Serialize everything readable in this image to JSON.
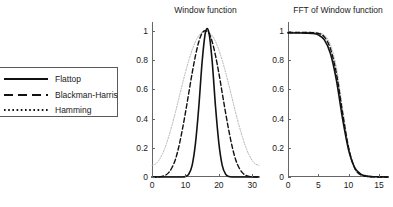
{
  "figure": {
    "background": "#ffffff",
    "width": 393,
    "height": 207
  },
  "legend": {
    "entries": [
      {
        "label": "Flattop",
        "style": "solid",
        "color": "#111111",
        "icon": "solid-line-icon"
      },
      {
        "label": "Blackman-Harris",
        "style": "dashed",
        "color": "#111111",
        "icon": "dashed-line-icon"
      },
      {
        "label": "Hamming",
        "style": "dotted",
        "color": "#111111",
        "icon": "dotted-line-icon"
      }
    ]
  },
  "chart_data": [
    {
      "type": "line",
      "id": "window-function",
      "title": "Window function",
      "xlabel": "",
      "ylabel": "",
      "xlim": [
        0,
        32
      ],
      "ylim": [
        0,
        1.06
      ],
      "grid": false,
      "legend_position": "outside-left",
      "xticks": [
        0,
        10,
        20,
        30
      ],
      "xtick_labels": [
        "0",
        "10",
        "20",
        "30"
      ],
      "yticks": [
        0,
        0.2,
        0.4,
        0.6,
        0.8,
        1
      ],
      "ytick_labels": [
        "0",
        "0.2",
        "0.4",
        "0.6",
        "0.8",
        "1"
      ],
      "x": [
        0,
        1,
        2,
        3,
        4,
        5,
        6,
        7,
        8,
        9,
        10,
        11,
        12,
        13,
        14,
        15,
        16,
        17,
        18,
        19,
        20,
        21,
        22,
        23,
        24,
        25,
        26,
        27,
        28,
        29,
        30,
        31,
        32
      ],
      "series": [
        {
          "name": "Flattop",
          "style": "solid",
          "color": "#111111",
          "width": 1.6,
          "values": [
            0,
            0,
            0,
            0,
            0,
            0,
            0,
            0,
            0,
            0,
            0.004,
            0.02,
            0.08,
            0.23,
            0.48,
            0.79,
            0.99,
            0.99,
            0.79,
            0.48,
            0.23,
            0.08,
            0.02,
            0.004,
            0,
            0,
            0,
            0,
            0,
            0,
            0,
            0,
            0
          ]
        },
        {
          "name": "Blackman-Harris",
          "style": "dashed",
          "color": "#111111",
          "width": 1.4,
          "values": [
            0,
            0.0001,
            0.001,
            0.004,
            0.012,
            0.03,
            0.065,
            0.12,
            0.205,
            0.315,
            0.44,
            0.575,
            0.71,
            0.83,
            0.925,
            0.985,
            1.0,
            0.985,
            0.925,
            0.83,
            0.71,
            0.575,
            0.44,
            0.315,
            0.205,
            0.12,
            0.065,
            0.03,
            0.012,
            0.004,
            0.001,
            0.0001,
            0
          ]
        },
        {
          "name": "Hamming",
          "style": "dotted",
          "color": "#b0b0b0",
          "width": 1.0,
          "values": [
            0.08,
            0.088,
            0.112,
            0.152,
            0.207,
            0.276,
            0.355,
            0.442,
            0.534,
            0.627,
            0.716,
            0.798,
            0.869,
            0.926,
            0.966,
            0.99,
            1.0,
            0.99,
            0.966,
            0.926,
            0.869,
            0.798,
            0.716,
            0.627,
            0.534,
            0.442,
            0.355,
            0.276,
            0.207,
            0.152,
            0.112,
            0.088,
            0.08
          ]
        }
      ]
    },
    {
      "type": "line",
      "id": "fft-of-window-function",
      "title": "FFT of Window function",
      "xlabel": "",
      "ylabel": "",
      "xlim": [
        0,
        16.5
      ],
      "ylim": [
        0,
        1.06
      ],
      "grid": false,
      "legend_position": "outside-left",
      "xticks": [
        0,
        5,
        10,
        15
      ],
      "xtick_labels": [
        "0",
        "5",
        "10",
        "15"
      ],
      "yticks": [
        0,
        0.2,
        0.4,
        0.6,
        0.8,
        1
      ],
      "ytick_labels": [
        "0",
        "0.2",
        "0.4",
        "0.6",
        "0.8",
        "1"
      ],
      "x": [
        0,
        1,
        2,
        3,
        4,
        5,
        6,
        7,
        8,
        9,
        10,
        11,
        12,
        13,
        14,
        15,
        16,
        16.5
      ],
      "series": [
        {
          "name": "Flattop",
          "style": "solid",
          "color": "#111111",
          "width": 1.6,
          "values": [
            0.985,
            0.985,
            0.985,
            0.984,
            0.982,
            0.972,
            0.938,
            0.845,
            0.66,
            0.4,
            0.185,
            0.065,
            0.02,
            0.006,
            0.002,
            0.001,
            0,
            0
          ]
        },
        {
          "name": "Blackman-Harris",
          "style": "dashed",
          "color": "#111111",
          "width": 1.4,
          "values": [
            0.988,
            0.988,
            0.988,
            0.988,
            0.987,
            0.982,
            0.958,
            0.878,
            0.705,
            0.44,
            0.2,
            0.062,
            0.015,
            0.004,
            0.001,
            0,
            0,
            0
          ]
        },
        {
          "name": "Hamming",
          "style": "dotted",
          "color": "#b0b0b0",
          "width": 1.0,
          "values": [
            0.99,
            0.99,
            0.99,
            0.99,
            0.99,
            0.987,
            0.97,
            0.905,
            0.745,
            0.47,
            0.205,
            0.055,
            0.012,
            0.003,
            0.001,
            0,
            0,
            0
          ]
        }
      ]
    }
  ]
}
